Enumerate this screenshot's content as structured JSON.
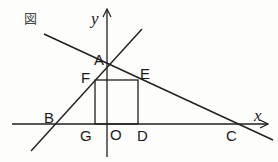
{
  "figure": {
    "caption": "図",
    "axes": {
      "x_label": "x",
      "y_label": "y",
      "origin_label": "O"
    },
    "points": {
      "A": "A",
      "B": "B",
      "C": "C",
      "D": "D",
      "E": "E",
      "F": "F",
      "G": "G"
    },
    "colors": {
      "line": "#1f1f1f",
      "background": "#fdfdfc"
    }
  }
}
